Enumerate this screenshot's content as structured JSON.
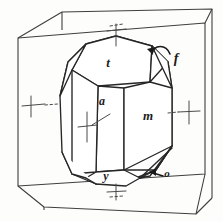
{
  "figure": {
    "kind": "crystal-form-diagram",
    "background_color": "#fdfdfb",
    "line_color": "#3a3a3a",
    "label_color": "#1a1a1a"
  },
  "labels": {
    "t": "t",
    "f": "f",
    "a": "a",
    "m": "m",
    "y": "y",
    "o": "o"
  },
  "label_positions": {
    "t": {
      "x": 108,
      "y": 67
    },
    "f": {
      "x": 176,
      "y": 63
    },
    "a": {
      "x": 102,
      "y": 105
    },
    "m": {
      "x": 148,
      "y": 120
    },
    "y": {
      "x": 106,
      "y": 180
    },
    "o": {
      "x": 167,
      "y": 177
    }
  },
  "reference_cube": {
    "front_top_left": {
      "x": 18,
      "y": 38
    },
    "front_top_right": {
      "x": 205,
      "y": 23
    },
    "front_bottom_left": {
      "x": 18,
      "y": 186
    },
    "front_bottom_right": {
      "x": 205,
      "y": 174
    },
    "back_top_left": {
      "x": 62,
      "y": 12
    },
    "back_top_right": {
      "x": 212,
      "y": 9
    },
    "back_bottom_left": {
      "x": 44,
      "y": 207
    },
    "back_bottom_right": {
      "x": 196,
      "y": 214
    }
  },
  "crystal_faces": [
    {
      "name": "t",
      "type": "top-pyramid-face"
    },
    {
      "name": "f",
      "type": "small-bevel-face"
    },
    {
      "name": "a",
      "type": "prism-face-front"
    },
    {
      "name": "m",
      "type": "prism-face-right"
    },
    {
      "name": "y",
      "type": "bottom-face"
    },
    {
      "name": "o",
      "type": "lower-bevel-face"
    }
  ],
  "axis_markers": [
    {
      "name": "axis-tick-top",
      "x": 116,
      "y": 30
    },
    {
      "name": "axis-tick-left",
      "x": 31,
      "y": 105
    },
    {
      "name": "axis-tick-right",
      "x": 189,
      "y": 112
    },
    {
      "name": "axis-tick-bottom",
      "x": 116,
      "y": 192
    },
    {
      "name": "axis-tick-center",
      "x": 87,
      "y": 127
    }
  ],
  "leaders": [
    {
      "name": "leader-f",
      "from": "f",
      "style": "curved-arrow"
    },
    {
      "name": "leader-o",
      "from": "o",
      "style": "straight-arrow"
    }
  ]
}
